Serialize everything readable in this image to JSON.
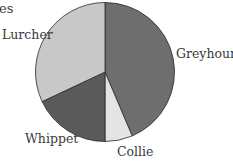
{
  "chart_data": {
    "type": "pie",
    "title": "es",
    "categories": [
      "Greyhound",
      "Collie",
      "Whippet",
      "Lurcher"
    ],
    "values": [
      43.6,
      6.4,
      18.0,
      32.0
    ],
    "degrees": [
      157,
      23,
      65,
      115
    ],
    "colors": [
      "#6e6e6e",
      "#e4e4e4",
      "#5a5a5a",
      "#c8c8c8"
    ],
    "start_angle": "top, clockwise",
    "legend": "none (direct labels)"
  },
  "labels": {
    "title": "es",
    "greyhound": "Greyhound",
    "collie": "Collie",
    "whippet": "Whippet",
    "lurcher": "Lurcher"
  }
}
